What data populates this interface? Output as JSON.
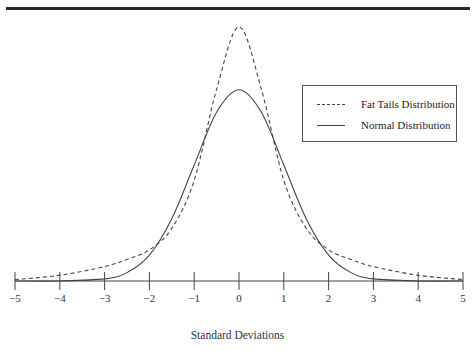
{
  "chart_data": {
    "type": "line",
    "title": "",
    "xlabel": "Standard Deviations",
    "ylabel": "",
    "xlim": [
      -5,
      5
    ],
    "ylim": [
      0,
      0.55
    ],
    "grid": false,
    "legend_position": "upper right",
    "x_ticks": [
      "-5",
      "-4",
      "-3",
      "-2",
      "-1",
      "0",
      "1",
      "2",
      "3",
      "4",
      "5"
    ],
    "series": [
      {
        "name": "Fat Tails Distribution",
        "style": "dashed",
        "x": [
          -5,
          -4,
          -3,
          -2.5,
          -2,
          -1.5,
          -1,
          -0.5,
          0,
          0.5,
          1,
          1.5,
          2,
          2.5,
          3,
          4,
          5
        ],
        "values": [
          0.003,
          0.012,
          0.03,
          0.045,
          0.065,
          0.11,
          0.21,
          0.4,
          0.53,
          0.4,
          0.21,
          0.11,
          0.065,
          0.045,
          0.03,
          0.012,
          0.003
        ]
      },
      {
        "name": "Normal Distribution",
        "style": "solid",
        "x": [
          -5,
          -4,
          -3,
          -2.5,
          -2,
          -1.5,
          -1,
          -0.5,
          0,
          0.5,
          1,
          1.5,
          2,
          2.5,
          3,
          4,
          5
        ],
        "values": [
          0.0,
          0.0001,
          0.0044,
          0.0175,
          0.054,
          0.13,
          0.242,
          0.352,
          0.399,
          0.352,
          0.242,
          0.13,
          0.054,
          0.0175,
          0.0044,
          0.0001,
          0.0
        ]
      }
    ]
  },
  "legend": {
    "items": [
      {
        "label": "Fat Tails Distribution",
        "style": "dashed"
      },
      {
        "label": "Normal Distribution",
        "style": "solid"
      }
    ]
  },
  "axis": {
    "xlabel": "Standard Deviations",
    "ticks": [
      "−5",
      "−4",
      "−3",
      "−2",
      "−1",
      "0",
      "1",
      "2",
      "3",
      "4",
      "5"
    ]
  },
  "colors": {
    "line": "#444444",
    "rule": "#2a2a2a"
  }
}
